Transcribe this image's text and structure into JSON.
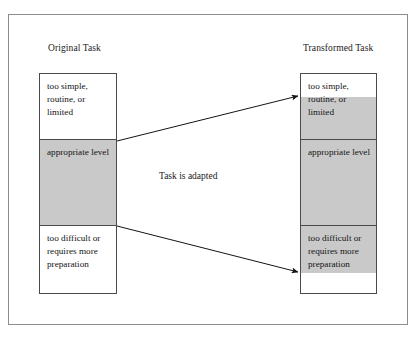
{
  "figure": {
    "caption_center": "Task is adapted",
    "frame_color": "#8d8d8d",
    "box_border_color": "#4a4a4a",
    "shade_color": "#c9c9c9",
    "background_color": "#ffffff"
  },
  "columns": {
    "original": {
      "heading": "Original Task",
      "cells": [
        {
          "text": "too simple, routine, or limited",
          "shaded": false
        },
        {
          "text": "appropriate level",
          "shaded": true
        },
        {
          "text": "too difficult or requires more preparation",
          "shaded": false
        }
      ]
    },
    "transformed": {
      "heading": "Transformed Task",
      "cells": [
        {
          "text": "too simple, routine, or limited",
          "shaded": "partial-lower"
        },
        {
          "text": "appropriate level",
          "shaded": true
        },
        {
          "text": "too difficult or requires more preparation",
          "shaded": "partial-upper"
        }
      ]
    }
  },
  "arrows": [
    {
      "name": "arrow-top-expand",
      "from_label": "Original Task upper divider",
      "to_label": "Transformed Task shading top",
      "x1": 117,
      "y1": 141,
      "x2": 299,
      "y2": 96
    },
    {
      "name": "arrow-bottom-expand",
      "from_label": "Original Task lower divider",
      "to_label": "Transformed Task shading bottom",
      "x1": 117,
      "y1": 226,
      "x2": 299,
      "y2": 272
    }
  ]
}
